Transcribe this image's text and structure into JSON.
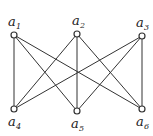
{
  "diagram": {
    "type": "bipartite-graph",
    "nodes": [
      {
        "id": "a1",
        "base": "a",
        "sub": "1",
        "x": 14,
        "y": 35,
        "lx": 8,
        "ly": 26
      },
      {
        "id": "a2",
        "base": "a",
        "sub": "2",
        "x": 77,
        "y": 34,
        "lx": 72,
        "ly": 25
      },
      {
        "id": "a3",
        "base": "a",
        "sub": "3",
        "x": 142,
        "y": 36,
        "lx": 136,
        "ly": 27
      },
      {
        "id": "a4",
        "base": "a",
        "sub": "4",
        "x": 14,
        "y": 109,
        "lx": 8,
        "ly": 126
      },
      {
        "id": "a5",
        "base": "a",
        "sub": "5",
        "x": 77,
        "y": 111,
        "lx": 71,
        "ly": 128
      },
      {
        "id": "a6",
        "base": "a",
        "sub": "6",
        "x": 142,
        "y": 109,
        "lx": 136,
        "ly": 126
      }
    ],
    "edges": [
      [
        "a1",
        "a4"
      ],
      [
        "a1",
        "a5"
      ],
      [
        "a1",
        "a6"
      ],
      [
        "a2",
        "a4"
      ],
      [
        "a2",
        "a5"
      ],
      [
        "a2",
        "a6"
      ],
      [
        "a3",
        "a4"
      ],
      [
        "a3",
        "a5"
      ],
      [
        "a3",
        "a6"
      ]
    ],
    "colors": {
      "line": "#333333",
      "node_fill": "#ffffff",
      "node_stroke": "#333333"
    }
  }
}
